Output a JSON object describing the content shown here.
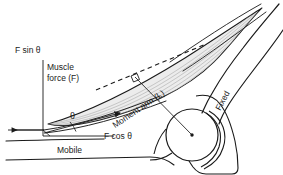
{
  "figure": {
    "type": "biomechanics-diagram",
    "width": 283,
    "height": 175,
    "background_color": "#ffffff",
    "line_color": "#1a1a1a",
    "muscle_fill_color": "#e8e8e8",
    "fiber_color": "#9a9a9a"
  },
  "labels": {
    "f_sin_theta": "F sin θ",
    "muscle_force": "Muscle\nforce (F)",
    "theta": "θ",
    "f_cos_theta": "F cos θ",
    "mobile": "Mobile",
    "moment_arm": "Moment arm (L)",
    "fixed": "Fixed"
  },
  "annotations": {
    "right_angle_marker": "right-angle-square",
    "line_of_action": "dashed",
    "joint_center": "center-of-rotation-dot"
  }
}
